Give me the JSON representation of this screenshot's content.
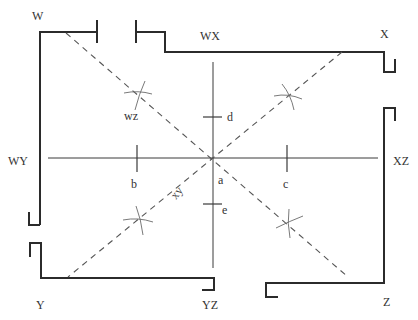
{
  "diagram": {
    "corner_labels": {
      "w": "W",
      "x": "X",
      "y": "Y",
      "z": "Z"
    },
    "wall_labels": {
      "wx": "WX",
      "wy": "WY",
      "xz": "XZ",
      "yz": "YZ"
    },
    "diagonal_labels": {
      "wz": "wz",
      "xy": "xy"
    },
    "point_labels": {
      "a": "a",
      "b": "b",
      "c": "c",
      "d": "d",
      "e": "e"
    },
    "colors": {
      "wall": "#2b2b2b",
      "axis": "#3a3a3a",
      "diagonal": "#555555",
      "arc": "#6a6a6a",
      "text": "#333333",
      "background": "#ffffff"
    }
  }
}
